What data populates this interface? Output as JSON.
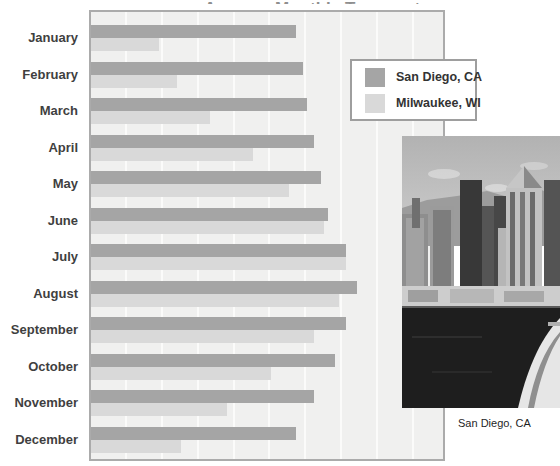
{
  "title": "Average Monthly Temperatures",
  "chart_data": {
    "type": "bar",
    "orientation": "horizontal",
    "title": "Average Monthly Temperatures",
    "categories": [
      "January",
      "February",
      "March",
      "April",
      "May",
      "June",
      "July",
      "August",
      "September",
      "October",
      "November",
      "December"
    ],
    "series": [
      {
        "name": "San Diego, CA",
        "color": "#a5a5a5",
        "values": [
          57,
          59,
          60,
          62,
          64,
          66,
          71,
          74,
          71,
          68,
          62,
          57
        ]
      },
      {
        "name": "Milwaukee, WI",
        "color": "#d9d9d9",
        "values": [
          19,
          24,
          33,
          45,
          55,
          65,
          71,
          69,
          62,
          50,
          38,
          25
        ]
      }
    ],
    "xlabel": "",
    "ylabel": "",
    "xlim": [
      0,
      98
    ],
    "grid": "vertical gridlines every 10 units, no tick labels visible",
    "legend_position": "upper-right overlay box"
  },
  "legend": {
    "items": [
      {
        "label": "San Diego, CA",
        "color": "#a5a5a5"
      },
      {
        "label": "Milwaukee, WI",
        "color": "#d9d9d9"
      }
    ]
  },
  "photo": {
    "caption": "San Diego, CA",
    "description": "grayscale aerial photo of San Diego skyline with harbor water and cruise ship bow"
  },
  "colors": {
    "bar_san_diego": "#a5a5a5",
    "bar_milwaukee": "#d9d9d9",
    "plot_background": "#f0f0ef",
    "plot_border": "#ababab",
    "legend_border": "#9e9e9e",
    "label_text": "#3f3f3f"
  }
}
